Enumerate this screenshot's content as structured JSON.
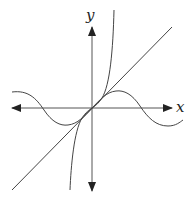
{
  "diagram": {
    "title": "",
    "axes": {
      "x_label": "x",
      "y_label": "y",
      "origin": [
        92,
        108
      ]
    },
    "curves": [
      {
        "name": "line",
        "description": "y = x (tangent line through origin)"
      },
      {
        "name": "cubic",
        "description": "steep odd curve, e.g. y = x + x^3"
      },
      {
        "name": "sine",
        "description": "y = sin(x)"
      }
    ],
    "colors": {
      "stroke": "#333333",
      "background": "#ffffff"
    }
  }
}
